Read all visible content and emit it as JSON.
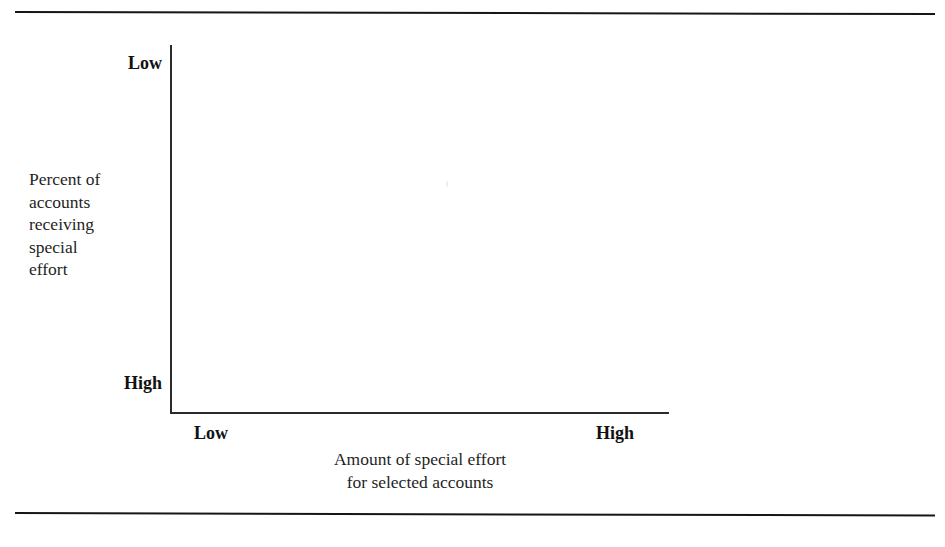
{
  "figure": {
    "background_color": "#ffffff",
    "ink_color": "#1a1a1a",
    "rule_color": "#161616",
    "axis_color": "#2b2b2b"
  },
  "axes": {
    "y_axis": {
      "caption_lines": [
        "Percent of",
        "accounts",
        "receiving",
        "special",
        "effort"
      ],
      "top_label": "Low",
      "bottom_label": "High"
    },
    "x_axis": {
      "caption_lines": [
        "Amount of special effort",
        "for selected accounts"
      ],
      "left_label": "Low",
      "right_label": "High"
    }
  },
  "chart_data": {
    "type": "scatter",
    "title": "",
    "subtitle": "",
    "xlabel": "Amount of special effort for selected accounts",
    "ylabel": "Percent of accounts receiving special effort",
    "x_tick_labels": [
      "Low",
      "High"
    ],
    "y_tick_labels": [
      "Low",
      "High"
    ],
    "x_axis_direction": "Low (left) to High (right)",
    "y_axis_direction": "Low (top) to High (bottom)",
    "grid": false,
    "legend": "none",
    "series": [],
    "x": [],
    "values": [],
    "annotations": [],
    "note": "Blank template grid: L-shaped axes drawn with qualitative Low/High endpoints and no plotted data points or curves."
  }
}
